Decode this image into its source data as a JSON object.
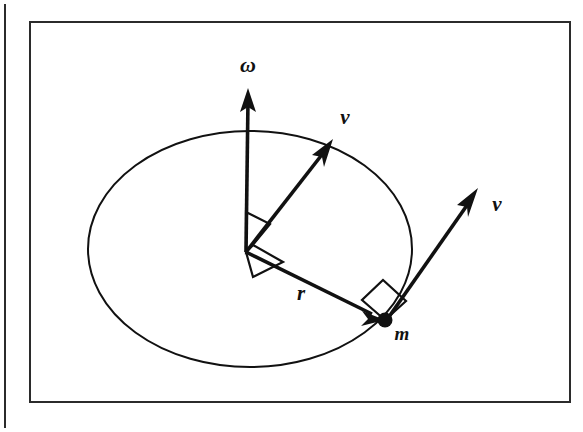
{
  "figure": {
    "kind": "physics-vector-diagram",
    "canvas": {
      "width": 583,
      "height": 432
    },
    "colors": {
      "ink": "#111111",
      "background": "#ffffff",
      "frame": "#2b2b2b"
    },
    "frame": {
      "left_rule": {
        "x": 5,
        "y1": 4,
        "y2": 428,
        "width": 2
      },
      "panel": {
        "x": 30,
        "y": 22,
        "width": 540,
        "height": 380,
        "border_width": 2
      }
    },
    "orbit": {
      "name": "circular-path-ellipse",
      "cx": 250,
      "cy": 249,
      "rx": 162,
      "ry": 118,
      "stroke_width": 2
    },
    "center": {
      "x": 246,
      "y": 252
    },
    "mass_point": {
      "x": 385,
      "y": 320,
      "radius": 7
    },
    "vectors": [
      {
        "id": "omega",
        "label": "ω",
        "label_x": 248,
        "label_y": 72,
        "x1": 246,
        "y1": 252,
        "x2": 248,
        "y2": 92,
        "stroke_width": 3.6,
        "head_length": 22,
        "head_width": 15
      },
      {
        "id": "v-tangential-at-center",
        "label": "v",
        "label_x": 345,
        "label_y": 124,
        "x1": 246,
        "y1": 252,
        "x2": 331,
        "y2": 142,
        "stroke_width": 3.6,
        "head_length": 22,
        "head_width": 15
      },
      {
        "id": "r-radius",
        "label": "r",
        "label_x": 301,
        "label_y": 300,
        "x1": 246,
        "y1": 252,
        "x2": 383,
        "y2": 319,
        "stroke_width": 3.6,
        "head_length": 20,
        "head_width": 14
      },
      {
        "id": "v-tangential-at-mass",
        "label": "v",
        "label_x": 497,
        "label_y": 211,
        "x1": 386,
        "y1": 321,
        "x2": 477,
        "y2": 190,
        "stroke_width": 3.6,
        "head_length": 22,
        "head_width": 15
      }
    ],
    "mass_label": {
      "text": "m",
      "x": 402,
      "y": 340
    },
    "right_angles": [
      {
        "id": "right-angle-omega-v",
        "points": "246,252 246,212 270,224 252,246",
        "stroke_width": 2.2
      },
      {
        "id": "right-angle-omega-r",
        "points": "246,252 252,246 282,262 252,276",
        "stroke_width": 2.2
      },
      {
        "id": "right-angle-r-v-at-mass",
        "points": "385,320 363,300 384,281 406,302",
        "stroke_width": 2.2
      }
    ],
    "label_font_sizes": {
      "omega": 22,
      "v": 21,
      "r": 21,
      "m": 19
    }
  }
}
